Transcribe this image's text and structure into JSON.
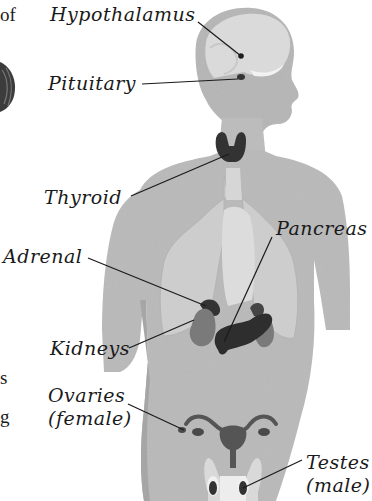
{
  "figure": {
    "type": "endocrine-system-diagram",
    "labels": [
      {
        "id": "hypothalamus",
        "text": "Hypothalamus"
      },
      {
        "id": "pituitary",
        "text": "Pituitary"
      },
      {
        "id": "thyroid",
        "text": "Thyroid"
      },
      {
        "id": "pancreas",
        "text": "Pancreas"
      },
      {
        "id": "adrenal",
        "text": "Adrenal"
      },
      {
        "id": "kidneys",
        "text": "Kidneys"
      },
      {
        "id": "ovaries",
        "text": "Ovaries",
        "subtext": "(female)"
      },
      {
        "id": "testes",
        "text": "Testes",
        "subtext": "(male)"
      }
    ],
    "colors": {
      "body": "#b9b9b9",
      "organ_light": "#d2d2d2",
      "gland_dark": "#3a3a3a",
      "kidney": "#7a7a7a",
      "text": "#1a1a1a"
    }
  },
  "left_margin_fragments": {
    "top": "of",
    "middle_1": "s",
    "middle_2": "g"
  }
}
